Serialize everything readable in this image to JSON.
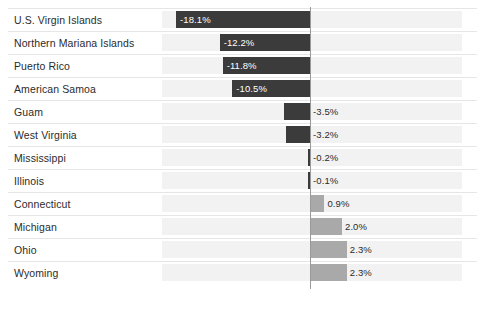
{
  "chart_data": {
    "type": "bar",
    "orientation": "horizontal",
    "title": "",
    "subtitle": "",
    "xlabel": "",
    "ylabel": "",
    "grid": false,
    "legend": null,
    "zero_line": true,
    "value_suffix": "%",
    "xlim": [
      -20.0,
      9.5
    ],
    "categories": [
      "U.S. Virgin Islands",
      "Northern Mariana Islands",
      "Puerto Rico",
      "American Samoa",
      "Guam",
      "West Virginia",
      "Mississippi",
      "Illinois",
      "Connecticut",
      "Michigan",
      "Ohio",
      "Wyoming"
    ],
    "values": [
      -18.1,
      -12.2,
      -11.8,
      -10.5,
      -3.5,
      -3.2,
      -0.2,
      -0.1,
      0.9,
      2.0,
      2.3,
      2.3
    ],
    "labels": [
      "-18.1%",
      "-12.2%",
      "-11.8%",
      "-10.5%",
      "-3.5%",
      "-3.2%",
      "-0.2%",
      "-0.1%",
      "0.9%",
      "2.0%",
      "2.3%",
      "2.3%"
    ],
    "colors": {
      "negative_bar": "#3b3b3b",
      "positive_bar": "#a9a9a9",
      "row_band": "#f2f2f2",
      "divider": "#e6e6e6",
      "zero_line": "#9a9a9a",
      "label_text": "#2b2b2b",
      "inside_value_text": "#ffffff",
      "background": "#ffffff"
    }
  },
  "layout": {
    "plot_left": 162,
    "plot_right": 462,
    "zero_x": 310,
    "first_row_top": 8,
    "row_height": 23,
    "bar_height": 17
  }
}
